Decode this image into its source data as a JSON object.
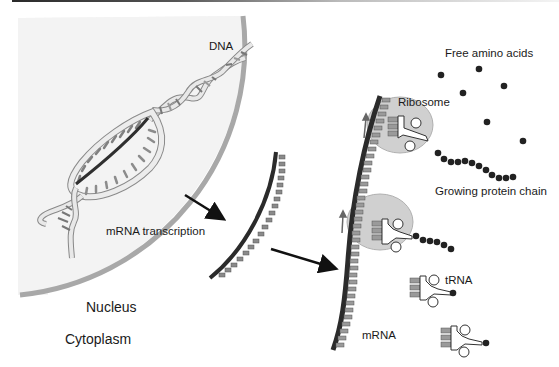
{
  "diagram": {
    "type": "protein-synthesis",
    "regions": {
      "nucleus_label": "Nucleus",
      "cytoplasm_label": "Cytoplasm"
    },
    "labels": {
      "dna": "DNA",
      "transcription": "mRNA transcription",
      "free_amino_acids": "Free amino acids",
      "ribosome": "Ribosome",
      "growing_chain": "Growing protein chain",
      "trna": "tRNA",
      "mrna": "mRNA"
    },
    "colors": {
      "nucleus_fill": "#f3f3f3",
      "nucleus_membrane": "#a8a8a8",
      "mrna_backbone": "#2b2b2b",
      "base": "#8a8a8a",
      "ribosome": "#d0d0d0",
      "amino_acid": "#222222",
      "arrow": "#111111"
    }
  }
}
